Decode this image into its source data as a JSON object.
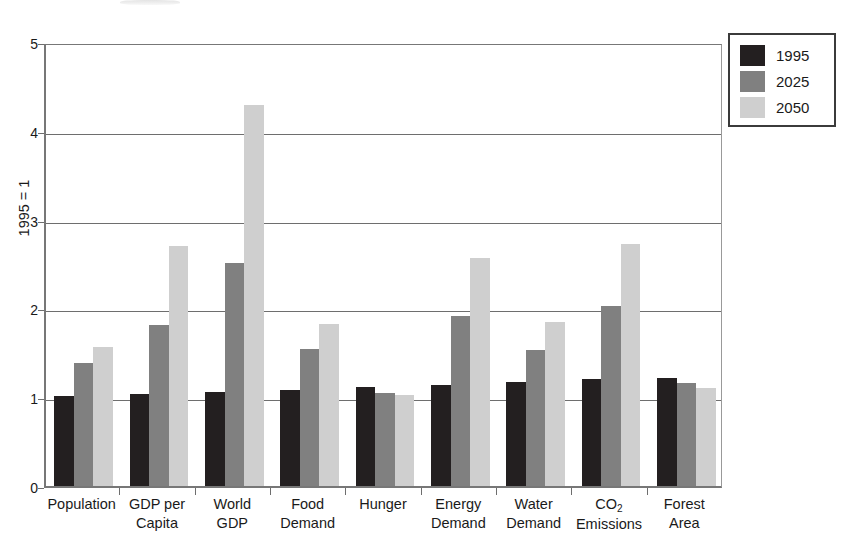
{
  "chart_data": {
    "type": "bar",
    "title": "",
    "xlabel": "",
    "ylabel": "1995 = 1",
    "ylim": [
      0,
      5
    ],
    "yticks": [
      0,
      1,
      2,
      3,
      4,
      5
    ],
    "grid": true,
    "legend_position": "top-right",
    "categories": [
      "Population",
      "GDP per Capita",
      "World GDP",
      "Food Demand",
      "Hunger",
      "Energy Demand",
      "Water Demand",
      "CO2 Emissions",
      "Forest Area"
    ],
    "category_lines": [
      [
        "Population",
        ""
      ],
      [
        "GDP per",
        "Capita"
      ],
      [
        "World",
        "GDP"
      ],
      [
        "Food",
        "Demand"
      ],
      [
        "Hunger",
        ""
      ],
      [
        "Energy",
        "Demand"
      ],
      [
        "Water",
        "Demand"
      ],
      [
        "CO₂",
        "Emissions"
      ],
      [
        "Forest",
        "Area"
      ]
    ],
    "series": [
      {
        "name": "1995",
        "color": "#231f20",
        "values": [
          1.01,
          1.04,
          1.06,
          1.08,
          1.11,
          1.14,
          1.17,
          1.2,
          1.22
        ]
      },
      {
        "name": "2025",
        "color": "#808080",
        "values": [
          1.38,
          1.81,
          2.51,
          1.54,
          1.05,
          1.92,
          1.53,
          2.03,
          1.16
        ]
      },
      {
        "name": "2050",
        "color": "#cfcfcf",
        "values": [
          1.57,
          2.7,
          4.29,
          1.82,
          1.03,
          2.57,
          1.85,
          2.73,
          1.1
        ]
      }
    ]
  },
  "legend": {
    "entries": [
      {
        "label": "1995",
        "color": "#231f20"
      },
      {
        "label": "2025",
        "color": "#808080"
      },
      {
        "label": "2050",
        "color": "#cfcfcf"
      }
    ]
  },
  "axis": {
    "y_title": "1995 = 1",
    "y_tick_labels": [
      "0",
      "1",
      "2",
      "3",
      "4",
      "5"
    ]
  }
}
